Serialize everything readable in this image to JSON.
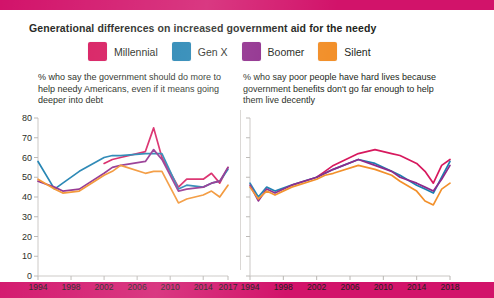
{
  "header": {
    "title": "Generational differences on increased government aid for the needy",
    "accent_color": "#d2136a"
  },
  "legend": {
    "items": [
      {
        "label": "Millennial",
        "color": "#d7195e"
      },
      {
        "label": "Gen X",
        "color": "#1b7fb0"
      },
      {
        "label": "Boomer",
        "color": "#8e2a8b"
      },
      {
        "label": "Silent",
        "color": "#f2902b"
      }
    ]
  },
  "chart_data": [
    {
      "id": "left",
      "type": "line",
      "title": "% who say the government should do more to help needy Americans, even if it means going deeper into debt",
      "xlabel": "",
      "ylabel": "",
      "ylim": [
        0,
        80
      ],
      "yticks": [
        0,
        10,
        20,
        30,
        40,
        50,
        60,
        70,
        80
      ],
      "xlim": [
        1994,
        2017
      ],
      "xticks": [
        1994,
        1998,
        2002,
        2006,
        2010,
        2014,
        2017
      ],
      "xticklabels": [
        "1994",
        "1998",
        "2002",
        "2006",
        "2010",
        "2014",
        "2017"
      ],
      "grid": false,
      "legend_position": "top",
      "series": [
        {
          "name": "Millennial",
          "color": "#d7195e",
          "x": [
            2002,
            2003,
            2004,
            2007,
            2008,
            2009,
            2011,
            2012,
            2014,
            2015,
            2016,
            2017
          ],
          "values": [
            57,
            59,
            60,
            63,
            75,
            60,
            45,
            49,
            49,
            52,
            47,
            55
          ]
        },
        {
          "name": "Gen X",
          "color": "#1b7fb0",
          "x": [
            1994,
            1996,
            1997,
            1999,
            2002,
            2003,
            2004,
            2007,
            2008,
            2009,
            2011,
            2012,
            2014,
            2015,
            2016,
            2017
          ],
          "values": [
            58,
            44,
            47,
            53,
            60,
            61,
            61,
            62,
            62,
            62,
            44,
            46,
            45,
            47,
            48,
            54
          ]
        },
        {
          "name": "Boomer",
          "color": "#8e2a8b",
          "x": [
            1994,
            1996,
            1997,
            1999,
            2002,
            2003,
            2004,
            2007,
            2008,
            2009,
            2011,
            2012,
            2014,
            2015,
            2016,
            2017
          ],
          "values": [
            48,
            45,
            43,
            44,
            52,
            55,
            56,
            58,
            64,
            59,
            43,
            44,
            45,
            47,
            48,
            55
          ]
        },
        {
          "name": "Silent",
          "color": "#f2902b",
          "x": [
            1994,
            1996,
            1997,
            1999,
            2002,
            2003,
            2004,
            2007,
            2008,
            2009,
            2011,
            2012,
            2014,
            2015,
            2016,
            2017
          ],
          "values": [
            49,
            44,
            42,
            43,
            51,
            53,
            56,
            52,
            53,
            53,
            37,
            39,
            41,
            43,
            40,
            46
          ]
        }
      ]
    },
    {
      "id": "right",
      "type": "line",
      "title": "% who say poor people have hard lives because government benefits don't go far enough to help them live decently",
      "xlabel": "",
      "ylabel": "",
      "ylim": [
        0,
        80
      ],
      "yticks": [
        0,
        10,
        20,
        30,
        40,
        50,
        60,
        70,
        80
      ],
      "xlim": [
        1994,
        2018
      ],
      "xticks": [
        1994,
        1998,
        2002,
        2006,
        2010,
        2014,
        2018
      ],
      "xticklabels": [
        "1994",
        "1998",
        "2002",
        "2006",
        "2010",
        "2014",
        "2018"
      ],
      "grid": false,
      "legend_position": "top",
      "series": [
        {
          "name": "Millennial",
          "color": "#d7195e",
          "x": [
            2002,
            2003,
            2004,
            2007,
            2009,
            2011,
            2012,
            2014,
            2015,
            2016,
            2017,
            2018
          ],
          "values": [
            50,
            53,
            56,
            62,
            64,
            62,
            61,
            57,
            53,
            47,
            56,
            59
          ]
        },
        {
          "name": "Gen X",
          "color": "#1b7fb0",
          "x": [
            1994,
            1995,
            1996,
            1997,
            1999,
            2002,
            2003,
            2004,
            2007,
            2009,
            2011,
            2012,
            2014,
            2015,
            2016,
            2017,
            2018
          ],
          "values": [
            47,
            40,
            45,
            43,
            46,
            50,
            52,
            54,
            59,
            57,
            53,
            51,
            46,
            44,
            42,
            50,
            58
          ]
        },
        {
          "name": "Boomer",
          "color": "#8e2a8b",
          "x": [
            1994,
            1995,
            1996,
            1997,
            1999,
            2002,
            2003,
            2004,
            2007,
            2009,
            2011,
            2012,
            2014,
            2015,
            2016,
            2017,
            2018
          ],
          "values": [
            46,
            38,
            44,
            42,
            46,
            50,
            52,
            54,
            59,
            56,
            53,
            50,
            47,
            45,
            43,
            49,
            56
          ]
        },
        {
          "name": "Silent",
          "color": "#f2902b",
          "x": [
            1994,
            1995,
            1996,
            1997,
            1999,
            2002,
            2003,
            2004,
            2007,
            2009,
            2011,
            2012,
            2014,
            2015,
            2016,
            2017,
            2018
          ],
          "values": [
            45,
            39,
            43,
            41,
            45,
            49,
            51,
            52,
            56,
            54,
            51,
            48,
            43,
            38,
            36,
            44,
            47
          ]
        }
      ]
    }
  ]
}
